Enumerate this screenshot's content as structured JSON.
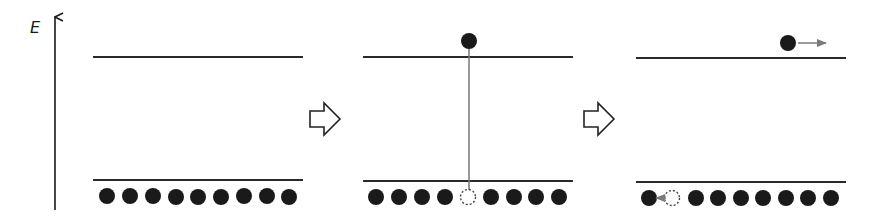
{
  "axis": {
    "label": "E",
    "direction": "up"
  },
  "colors": {
    "line": "#2a2a2a",
    "electron": "#1a1a1a",
    "hole_outline": "#444444",
    "transition": "#777777",
    "motion_arrow": "#7a7a7a",
    "step_arrow_outline": "#222222"
  },
  "panels": [
    {
      "name": "ground-state",
      "upper_level": "conduction band",
      "lower_level": "valence band",
      "valence_slots": [
        "electron",
        "electron",
        "electron",
        "electron",
        "electron",
        "electron",
        "electron",
        "electron",
        "electron"
      ],
      "conduction_electrons": 0
    },
    {
      "name": "excitation",
      "upper_level": "conduction band",
      "lower_level": "valence band",
      "valence_slots": [
        "electron",
        "electron",
        "electron",
        "electron",
        "hole",
        "electron",
        "electron",
        "electron",
        "electron"
      ],
      "conduction_electrons": 1,
      "transition": "vertical excitation from valence hole to conduction electron"
    },
    {
      "name": "carrier-motion",
      "upper_level": "conduction band",
      "lower_level": "valence band",
      "valence_slots": [
        "electron",
        "hole",
        "electron",
        "electron",
        "electron",
        "electron",
        "electron",
        "electron",
        "electron"
      ],
      "conduction_electrons": 1,
      "electron_motion": "right",
      "hole_motion": "left"
    }
  ],
  "step_arrows": 2
}
